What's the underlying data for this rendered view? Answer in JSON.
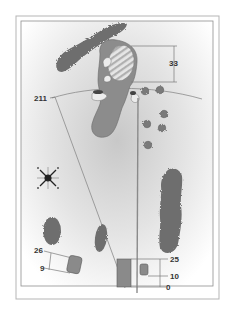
{
  "diagram": {
    "type": "golf-hole-yardage-map",
    "colors": {
      "frame": "#9a9a9a",
      "fairway": "#8c8c8c",
      "green": "#8a8a8a",
      "green_hatch": "#cfcfcf",
      "tree": "#6e6e6e",
      "sand": "#ececec",
      "line": "#7a7a7a",
      "tee": "#8a8a8a",
      "label": "#333333"
    },
    "labels": {
      "green_depth": "33",
      "carry_distance": "211",
      "back_tee_left_top": "26",
      "back_tee_left_bottom": "9",
      "tee_right_top": "25",
      "tee_right_mid": "10",
      "tee_right_bottom": "0"
    },
    "icons": {
      "compass": "compass-rose-icon"
    }
  }
}
